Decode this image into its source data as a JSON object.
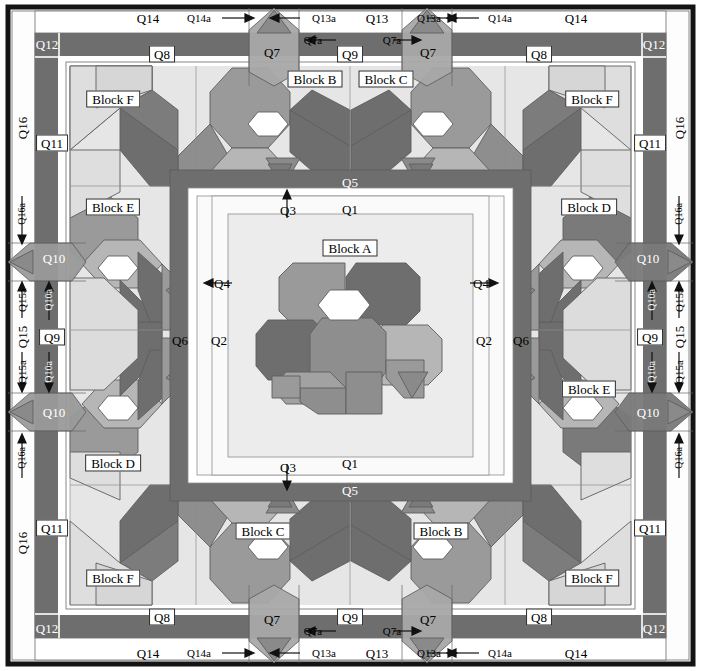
{
  "diagram": {
    "type": "quilt-construction-schematic",
    "palette": {
      "background": "#ffffff",
      "frame_black": "#141414",
      "dark_gray": "#6e6e6e",
      "mid_gray": "#969696",
      "light_gray": "#b4b4b4",
      "pale_gray": "#d2d2d2",
      "very_pale": "#e4e4e4",
      "near_white": "#f2f2f2",
      "patch_white": "#ffffff",
      "line": "#555555"
    }
  },
  "blocks": {
    "a": "Block A",
    "b": "Block B",
    "c": "Block C",
    "d": "Block D",
    "e": "Block E",
    "f": "Block F"
  },
  "labels": {
    "q1": "Q1",
    "q2": "Q2",
    "q3": "Q3",
    "q4": "Q4",
    "q5": "Q5",
    "q6": "Q6",
    "q7": "Q7",
    "q7a": "Q7a",
    "q8": "Q8",
    "q9": "Q9",
    "q10": "Q10",
    "q10a": "Q10a",
    "q11": "Q11",
    "q12": "Q12",
    "q13": "Q13",
    "q13a": "Q13a",
    "q14": "Q14",
    "q14a": "Q14a",
    "q15": "Q15",
    "q15a": "Q15a",
    "q16": "Q16",
    "q16a": "Q16a"
  },
  "annotations": {
    "top": {
      "q14_left": "Q14",
      "q14a_left": "Q14a",
      "q13a_left": "Q13a",
      "q13": "Q13",
      "q13a_right": "Q13a",
      "q14a_right": "Q14a",
      "q14_right": "Q14",
      "q12_left": "Q12",
      "q12_right": "Q12",
      "q8_left": "Q8",
      "q8_right": "Q8",
      "q7_left": "Q7",
      "q7_right": "Q7",
      "q7a_left": "Q7a",
      "q7a_right": "Q7a",
      "q9": "Q9"
    },
    "bottom": {
      "q14_left": "Q14",
      "q14a_left": "Q14a",
      "q13a_left": "Q13a",
      "q13": "Q13",
      "q13a_right": "Q13a",
      "q14a_right": "Q14a",
      "q14_right": "Q14",
      "q12_left": "Q12",
      "q12_right": "Q12",
      "q8_left": "Q8",
      "q8_right": "Q8",
      "q7_left": "Q7",
      "q7_right": "Q7",
      "q7a_left": "Q7a",
      "q7a_right": "Q7a",
      "q9": "Q9"
    },
    "left": {
      "q16": "Q16",
      "q16a_top": "Q16a",
      "q16a_bottom": "Q16a",
      "q15": "Q15",
      "q15a_top": "Q15a",
      "q15a_bottom": "Q15a",
      "q11_top": "Q11",
      "q11_bottom": "Q11",
      "q10_top": "Q10",
      "q10_bottom": "Q10",
      "q10a_top": "Q10a",
      "q10a_bottom": "Q10a",
      "q9": "Q9",
      "q16_top": "Q16",
      "q16_bottom": "Q16"
    },
    "right": {
      "q16": "Q16",
      "q16a_top": "Q16a",
      "q16a_bottom": "Q16a",
      "q15": "Q15",
      "q15a_top": "Q15a",
      "q15a_bottom": "Q15a",
      "q11_top": "Q11",
      "q11_bottom": "Q11",
      "q10_top": "Q10",
      "q10_bottom": "Q10",
      "q10a_top": "Q10a",
      "q10a_bottom": "Q10a",
      "q9": "Q9"
    },
    "center": {
      "q5_top": "Q5",
      "q5_bottom": "Q5",
      "q3_top": "Q3",
      "q3_bottom": "Q3",
      "q1_top": "Q1",
      "q1_bottom": "Q1",
      "q4_left": "Q4",
      "q4_right": "Q4",
      "q2_left": "Q2",
      "q2_right": "Q2",
      "q6_left": "Q6",
      "q6_right": "Q6"
    }
  }
}
